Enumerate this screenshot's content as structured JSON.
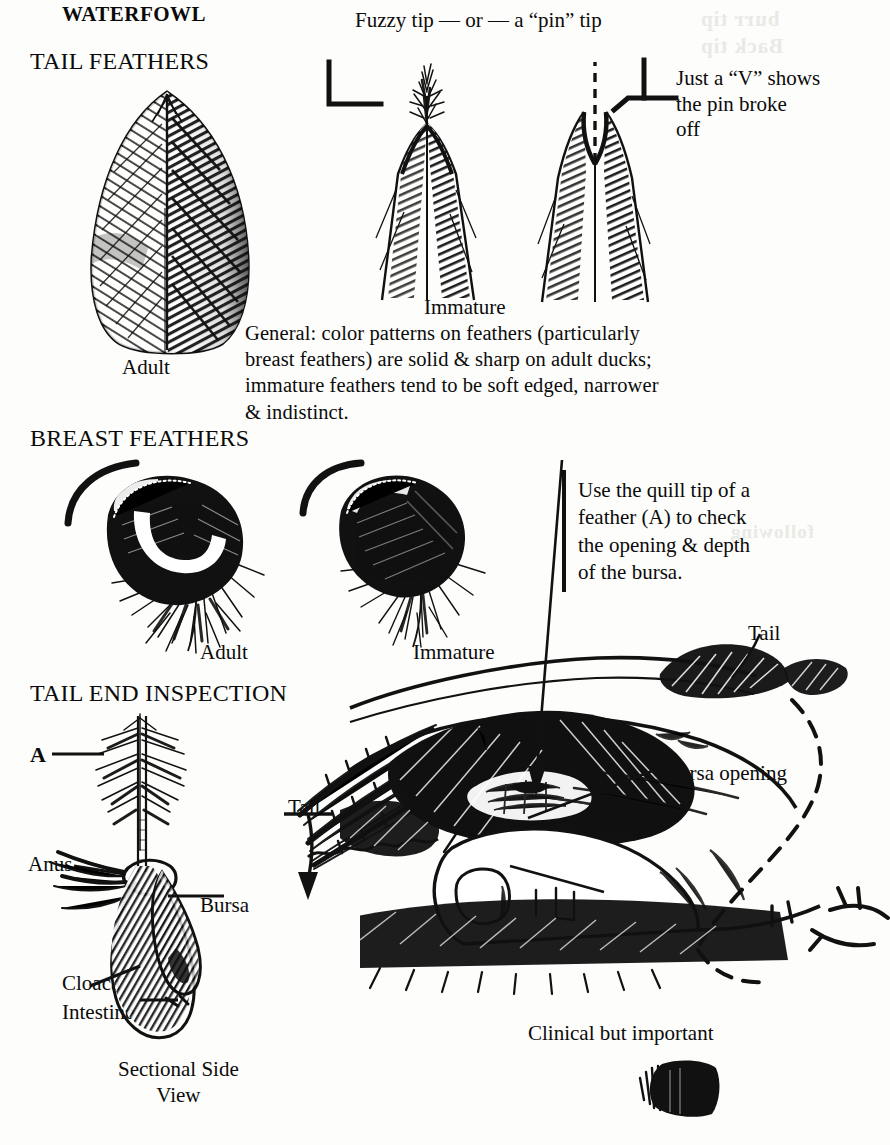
{
  "document": {
    "title": "WATERFOWL",
    "subject": "Waterfowl aging field guide plate",
    "ink_color": "#111111",
    "paper_color": "#fdfdfb"
  },
  "headings": {
    "waterfowl": "WATERFOWL",
    "tail_feathers": "TAIL FEATHERS",
    "breast_feathers": "BREAST FEATHERS",
    "tail_end_inspection": "TAIL END INSPECTION"
  },
  "tail_feathers": {
    "tip_caption": "Fuzzy tip — or — a “pin” tip",
    "adult_label": "Adult",
    "immature_label": "Immature",
    "pin_broke_note": "Just a “V” shows\nthe pin broke\noff",
    "general_note": "General: color patterns on feathers (particularly\nbreast feathers) are solid & sharp on adult ducks;\nimmature feathers tend to be soft edged, narrower\n& indistinct."
  },
  "breast_feathers": {
    "adult_label": "Adult",
    "immature_label": "Immature"
  },
  "tail_end_inspection": {
    "quill_instruction": "Use the quill tip of a\nfeather (A) to check\nthe opening & depth\nof the bursa.",
    "feather_marker": "A",
    "tail_label_left": "Tail",
    "tail_label_right": "Tail",
    "anus_label_left": "Anus",
    "anus_label_right": "Anus",
    "bursa_label": "Bursa",
    "bursa_opening_label": "Bursa opening",
    "cloaca_label": "Cloaca",
    "intestine_label": "Intestine",
    "sectional_caption": "Sectional Side\nView",
    "clinical_caption": "Clinical but important"
  },
  "bleed_through": {
    "top_right": "burr tip\nBack tip",
    "mid_right": "following"
  }
}
